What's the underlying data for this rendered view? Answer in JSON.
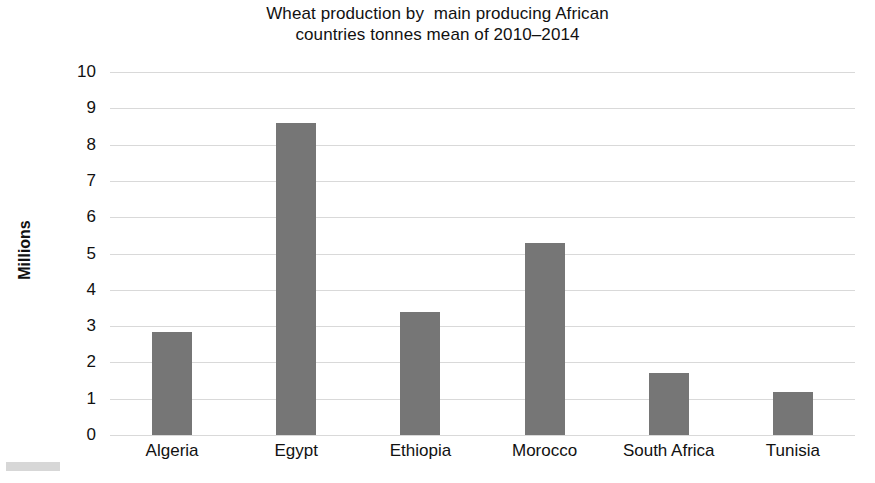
{
  "chart_data": {
    "type": "bar",
    "title": "Wheat production by  main producing African\ncountries tonnes mean of 2010–2014",
    "title_line1": "Wheat production by  main producing African",
    "title_line2": "countries tonnes mean of 2010–2014",
    "xlabel": "",
    "ylabel": "Millions",
    "ylim": [
      0,
      10
    ],
    "ytick_labels": [
      "10",
      "9",
      "8",
      "7",
      "6",
      "5",
      "4",
      "3",
      "2",
      "1",
      "0"
    ],
    "ytick_values": [
      10,
      9,
      8,
      7,
      6,
      5,
      4,
      3,
      2,
      1,
      0
    ],
    "grid": true,
    "legend": false,
    "legend_position": "none",
    "bar_color": "#767676",
    "grid_color": "#d9d9d9",
    "categories": [
      "Algeria",
      "Egypt",
      "Ethiopia",
      "Morocco",
      "South Africa",
      "Tunisia"
    ],
    "values": [
      2.85,
      8.6,
      3.4,
      5.3,
      1.72,
      1.18
    ],
    "bars": [
      {
        "label": "Algeria",
        "value": 2.85
      },
      {
        "label": "Egypt",
        "value": 8.6
      },
      {
        "label": "Ethiopia",
        "value": 3.4
      },
      {
        "label": "Morocco",
        "value": 5.3
      },
      {
        "label": "South Africa",
        "value": 1.72
      },
      {
        "label": "Tunisia",
        "value": 1.18
      }
    ]
  }
}
